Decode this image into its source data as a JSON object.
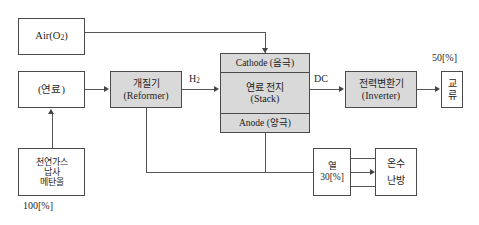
{
  "diagram": {
    "colors": {
      "shaded_fill": "#d9d9d9",
      "box_border": "#4a4a4a",
      "line": "#555555",
      "background": "#ffffff"
    }
  },
  "blocks": {
    "air": {
      "label": "Air",
      "formula_open": "(O",
      "formula_sub": "2",
      "formula_close": ")",
      "full": "Air(O₂)"
    },
    "fuel": {
      "label": "(연료)"
    },
    "source": {
      "line1": "천연가스",
      "line2": "납사",
      "line3": "메탄올"
    },
    "reformer": {
      "line1": "개질기",
      "line2": "(Reformer)"
    },
    "stack": {
      "cathode": "Cathode (음극)",
      "middle_line1": "연료 전지",
      "middle_line2": "(Stack)",
      "anode": "Anode (양극)"
    },
    "inverter": {
      "line1": "전력변환기",
      "line2": "(Inverter)"
    },
    "ac_output": {
      "char1": "교",
      "char2": "류"
    },
    "heat": {
      "line1": "열",
      "line2": "30[%]"
    },
    "hotwater": {
      "line1": "온수",
      "line2": "난방"
    }
  },
  "labels": {
    "hydrogen": "H₂",
    "hydrogen_main": "H",
    "hydrogen_sub": "2",
    "dc": "DC",
    "efficiency_electric": "50[%]",
    "efficiency_input": "100[%]"
  },
  "flows": [
    {
      "from": "air",
      "to": "stack-cathode",
      "label": ""
    },
    {
      "from": "source",
      "to": "fuel",
      "label": "100[%]"
    },
    {
      "from": "fuel",
      "to": "reformer",
      "label": ""
    },
    {
      "from": "reformer",
      "to": "stack",
      "label": "H₂"
    },
    {
      "from": "reformer",
      "to": "heat",
      "label": ""
    },
    {
      "from": "stack-anode",
      "to": "heat",
      "label": ""
    },
    {
      "from": "stack",
      "to": "inverter",
      "label": "DC"
    },
    {
      "from": "inverter",
      "to": "ac_output",
      "label": "50[%]"
    },
    {
      "from": "heat",
      "to": "hotwater",
      "label": "30[%]"
    }
  ]
}
